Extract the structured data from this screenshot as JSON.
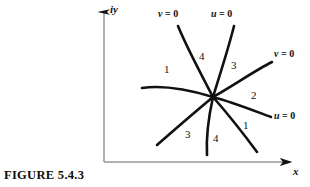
{
  "figure": {
    "caption": "FIGURE 5.4.3",
    "background_color": "#ffffff",
    "ink_color": "#111111",
    "axis_color": "#9a9a9a"
  },
  "axes": {
    "y_label": "iy",
    "x_label": "x",
    "origin": {
      "x": 104,
      "y": 162
    },
    "y_top": {
      "x": 104,
      "y": 10
    },
    "x_right": {
      "x": 296,
      "y": 162
    }
  },
  "center": {
    "x": 213,
    "y": 97
  },
  "curves": [
    {
      "id": "curve-upper-left-v0",
      "label": "v = 0",
      "label_var": "v",
      "label_rest": " = 0",
      "label_pos": {
        "x": 158,
        "y": 9
      },
      "path": "M 178 26 C 187 48, 200 72, 213 97"
    },
    {
      "id": "curve-upper-right-u0",
      "label": "u = 0",
      "label_var": "u",
      "label_rest": " = 0",
      "label_pos": {
        "x": 211,
        "y": 9
      },
      "path": "M 234 26 C 228 50, 220 74, 213 97"
    },
    {
      "id": "curve-right-upper-v0",
      "label": "v = 0",
      "label_var": "v",
      "label_rest": " = 0",
      "label_pos": {
        "x": 274,
        "y": 49
      },
      "path": "M 272 62 C 256 70, 234 85, 213 97"
    },
    {
      "id": "curve-right-lower-u0",
      "label": "u = 0",
      "label_var": "u",
      "label_rest": " = 0",
      "label_pos": {
        "x": 274,
        "y": 111
      },
      "path": "M 271 117 C 252 110, 232 102, 213 97"
    },
    {
      "id": "curve-left-middle",
      "label": "",
      "path": "M 142 88 C 163 85, 190 90, 213 97"
    },
    {
      "id": "curve-lower-left",
      "label": "",
      "path": "M 157 145 C 173 131, 195 112, 213 97"
    },
    {
      "id": "curve-lower-middle",
      "label": "",
      "path": "M 207 155 C 206 137, 209 115, 213 97"
    },
    {
      "id": "curve-lower-right",
      "label": "",
      "path": "M 257 152 C 243 133, 227 113, 213 97"
    }
  ],
  "regions": [
    {
      "id": "region-upper-1",
      "label": "1",
      "x": 164,
      "y": 64
    },
    {
      "id": "region-upper-4",
      "label": "4",
      "x": 199,
      "y": 51
    },
    {
      "id": "region-upper-3",
      "label": "3",
      "x": 231,
      "y": 60
    },
    {
      "id": "region-upper-2",
      "label": "2",
      "x": 251,
      "y": 90
    },
    {
      "id": "region-lower-1",
      "label": "1",
      "x": 243,
      "y": 120
    },
    {
      "id": "region-lower-4",
      "label": "4",
      "x": 213,
      "y": 133
    },
    {
      "id": "region-lower-3",
      "label": "3",
      "x": 185,
      "y": 129
    }
  ]
}
